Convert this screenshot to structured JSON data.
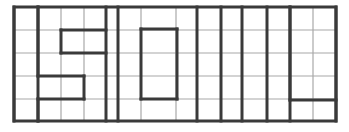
{
  "diagram": {
    "title": "",
    "word": "SOIL",
    "colors": {
      "background": "#ffffff",
      "thin_line": "#a8a8a8",
      "thick_line": "#3a3a3a"
    },
    "grid": {
      "rows": 5,
      "columns": 14,
      "left": 14,
      "right": 336,
      "top": 7,
      "bottom": 121,
      "row_lines": [
        7,
        30,
        53,
        76,
        99,
        121
      ],
      "col_lines": [
        14,
        38,
        61,
        84,
        106,
        118,
        141,
        176,
        197,
        221,
        242,
        267,
        290,
        313,
        336
      ]
    },
    "thick_verticals": [
      14,
      38,
      106,
      118,
      197,
      221,
      242,
      267,
      290,
      336
    ],
    "letters": [
      {
        "letter": "S",
        "segments": [
          [
            38,
            7,
            38,
            76
          ],
          [
            61,
            30,
            106,
            30
          ],
          [
            61,
            30,
            61,
            53
          ],
          [
            61,
            53,
            106,
            53
          ],
          [
            38,
            76,
            84,
            76
          ],
          [
            84,
            76,
            84,
            99
          ],
          [
            38,
            99,
            84,
            99
          ],
          [
            38,
            99,
            38,
            121
          ]
        ]
      },
      {
        "letter": "O",
        "segments": [
          [
            141,
            29,
            177,
            29
          ],
          [
            177,
            29,
            177,
            99
          ],
          [
            141,
            99,
            177,
            99
          ],
          [
            141,
            29,
            141,
            99
          ]
        ]
      },
      {
        "letter": "I",
        "segments": []
      },
      {
        "letter": "L",
        "segments": [
          [
            290,
            7,
            290,
            100
          ],
          [
            290,
            100,
            336,
            100
          ]
        ]
      }
    ]
  }
}
